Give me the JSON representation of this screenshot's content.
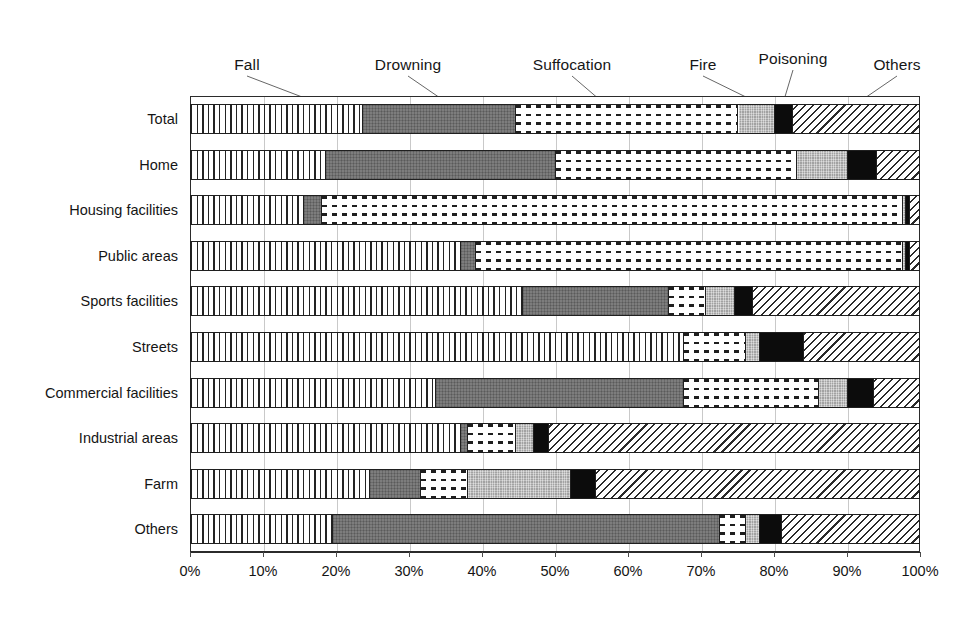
{
  "chart_data": {
    "type": "bar",
    "subtype": "stacked-horizontal-100pct",
    "title": "",
    "xlabel": "",
    "ylabel": "",
    "xlim": [
      0,
      100
    ],
    "xtick_labels": [
      "0%",
      "10%",
      "20%",
      "30%",
      "40%",
      "50%",
      "60%",
      "70%",
      "80%",
      "90%",
      "100%"
    ],
    "xtick_values": [
      0,
      10,
      20,
      30,
      40,
      50,
      60,
      70,
      80,
      90,
      100
    ],
    "grid": true,
    "legend_position": "top-callouts",
    "orientation": "horizontal",
    "units": "percent",
    "categories": [
      "Total",
      "Home",
      "Housing facilities",
      "Public areas",
      "Sports facilities",
      "Streets",
      "Commercial facilities",
      "Industrial areas",
      "Farm",
      "Others"
    ],
    "series": [
      {
        "name": "Fall",
        "pattern": "vertical-lines",
        "color": "#ffffff",
        "values": [
          23.5,
          18.5,
          15.5,
          37.0,
          45.5,
          67.5,
          33.5,
          37.0,
          24.5,
          19.5
        ]
      },
      {
        "name": "Drowning",
        "pattern": "solid-dark-gray",
        "color": "#6f6f6f",
        "values": [
          21.0,
          31.5,
          2.5,
          2.0,
          20.0,
          0.0,
          34.0,
          1.0,
          7.0,
          53.0
        ]
      },
      {
        "name": "Suffocation",
        "pattern": "dashed-dots",
        "color": "#ffffff",
        "values": [
          30.5,
          33.0,
          79.5,
          58.5,
          5.0,
          8.5,
          18.5,
          6.5,
          6.5,
          3.5
        ]
      },
      {
        "name": "Fire",
        "pattern": "light-gray",
        "color": "#b4b4b4",
        "values": [
          5.0,
          7.0,
          0.5,
          0.5,
          4.0,
          2.0,
          4.0,
          2.5,
          14.0,
          2.0
        ]
      },
      {
        "name": "Poisoning",
        "pattern": "solid-black",
        "color": "#0c0c0c",
        "values": [
          2.5,
          4.0,
          0.5,
          0.5,
          2.5,
          6.0,
          3.5,
          2.0,
          3.5,
          3.0
        ]
      },
      {
        "name": "Others",
        "pattern": "diagonal-hatch",
        "color": "#ffffff",
        "values": [
          17.5,
          6.0,
          1.5,
          1.5,
          23.0,
          16.0,
          6.5,
          51.0,
          44.5,
          19.0
        ]
      }
    ],
    "callouts": [
      {
        "label": "Fall",
        "label_x": 247,
        "label_y": 56,
        "line_to_x": 310,
        "line_to_y": 100
      },
      {
        "label": "Drowning",
        "label_x": 408,
        "label_y": 56,
        "line_to_x": 443,
        "line_to_y": 100
      },
      {
        "label": "Suffocation",
        "label_x": 572,
        "label_y": 56,
        "line_to_x": 600,
        "line_to_y": 100
      },
      {
        "label": "Fire",
        "label_x": 703,
        "label_y": 56,
        "line_to_x": 752,
        "line_to_y": 100
      },
      {
        "label": "Poisoning",
        "label_x": 793,
        "label_y": 50,
        "line_to_x": 784,
        "line_to_y": 100
      },
      {
        "label": "Others",
        "label_x": 897,
        "label_y": 56,
        "line_to_x": 862,
        "line_to_y": 100
      }
    ]
  }
}
